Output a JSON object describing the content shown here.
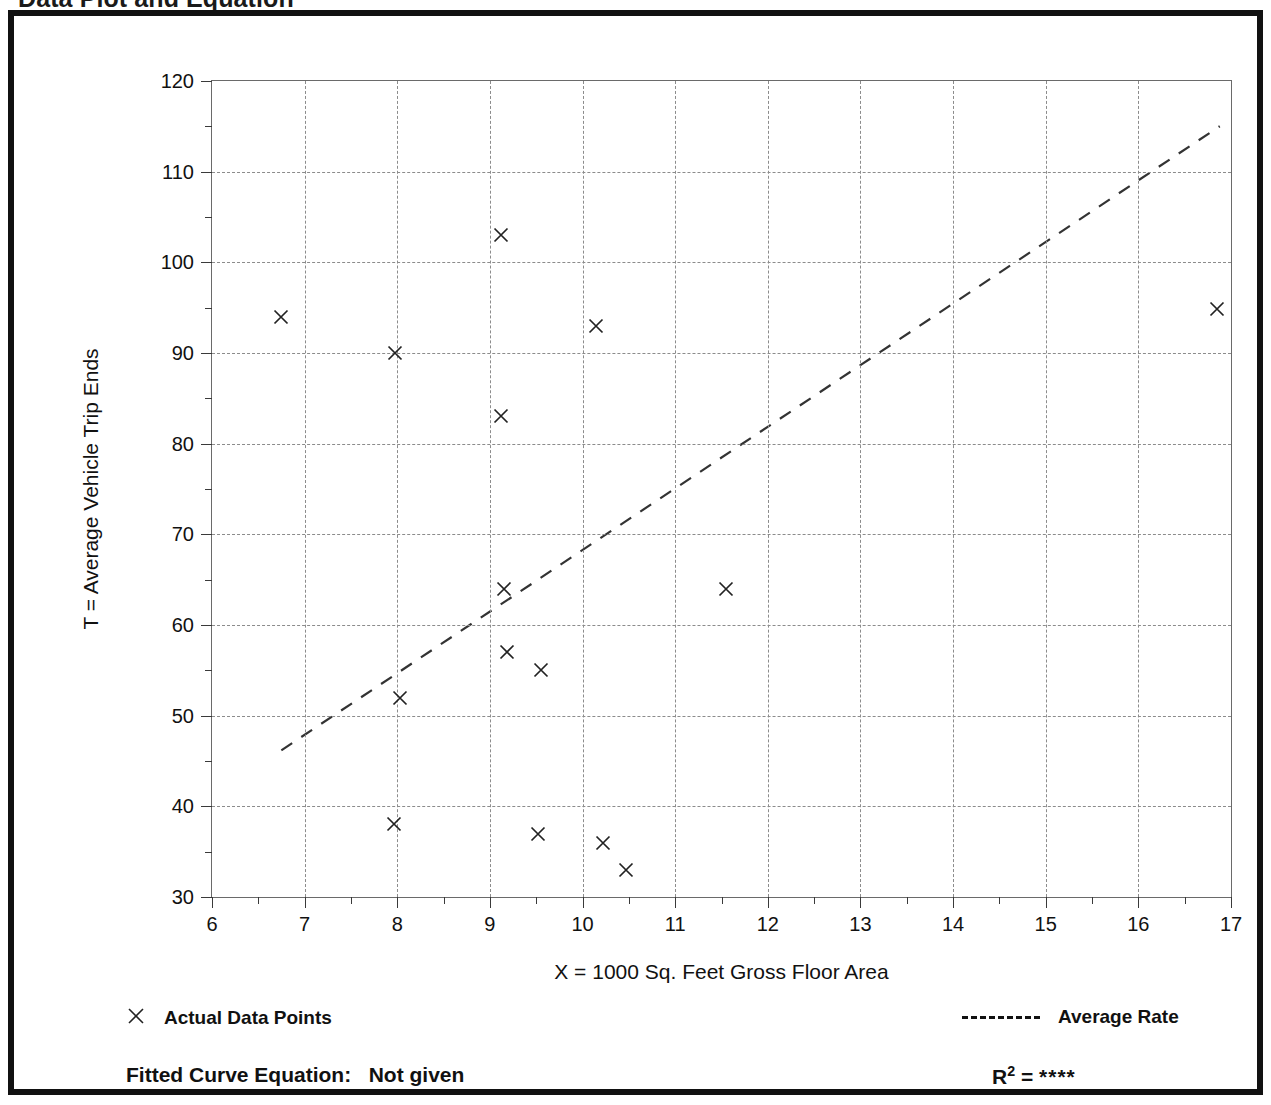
{
  "document": {
    "title": "Data Plot and Equation"
  },
  "axis_titles": {
    "x": "X = 1000 Sq. Feet Gross Floor Area",
    "y": "T = Average Vehicle Trip Ends"
  },
  "legend": {
    "data_points_label": "Actual Data Points",
    "average_rate_label": "Average Rate",
    "marker_icon": "x-cross-marker",
    "line_icon": "dashed-line-swatch"
  },
  "footer": {
    "equation_label": "Fitted Curve Equation:",
    "equation_value": "Not given",
    "r2_label": "R",
    "r2_exponent": "2",
    "r2_equals": "=",
    "r2_value": "****"
  },
  "chart_data": {
    "type": "scatter",
    "title": "Data Plot and Equation",
    "xlabel": "X = 1000 Sq. Feet Gross Floor Area",
    "ylabel": "T = Average Vehicle Trip Ends",
    "xlim": [
      6,
      17
    ],
    "ylim": [
      30,
      120
    ],
    "xticks": [
      6,
      7,
      8,
      9,
      10,
      11,
      12,
      13,
      14,
      15,
      16,
      17
    ],
    "xticklabels": [
      "6",
      "7",
      "8",
      "9",
      "10",
      "11",
      "12",
      "13",
      "14",
      "15",
      "16",
      "17"
    ],
    "xminor_step": 0.5,
    "yticks": [
      30,
      40,
      50,
      60,
      70,
      80,
      90,
      100,
      110,
      120
    ],
    "yticklabels": [
      "30",
      "40",
      "50",
      "60",
      "70",
      "80",
      "90",
      "100",
      "110",
      "120"
    ],
    "yminor_step": 5,
    "grid": true,
    "grid_style": "dashed",
    "legend_position": "below-plot",
    "series": [
      {
        "name": "Actual Data Points",
        "type": "scatter",
        "marker": "x",
        "points": [
          {
            "x": 6.75,
            "y": 94
          },
          {
            "x": 7.98,
            "y": 90
          },
          {
            "x": 8.03,
            "y": 52
          },
          {
            "x": 7.97,
            "y": 38
          },
          {
            "x": 9.12,
            "y": 103
          },
          {
            "x": 9.12,
            "y": 83
          },
          {
            "x": 9.15,
            "y": 64
          },
          {
            "x": 9.18,
            "y": 57
          },
          {
            "x": 9.55,
            "y": 55
          },
          {
            "x": 9.52,
            "y": 37
          },
          {
            "x": 10.15,
            "y": 93
          },
          {
            "x": 10.22,
            "y": 36
          },
          {
            "x": 10.47,
            "y": 33
          },
          {
            "x": 11.55,
            "y": 64
          },
          {
            "x": 16.85,
            "y": 94.8
          }
        ]
      },
      {
        "name": "Average Rate",
        "type": "line",
        "style": "dashed",
        "endpoints": [
          {
            "x": 6.75,
            "y": 46
          },
          {
            "x": 16.9,
            "y": 115
          }
        ]
      }
    ]
  }
}
